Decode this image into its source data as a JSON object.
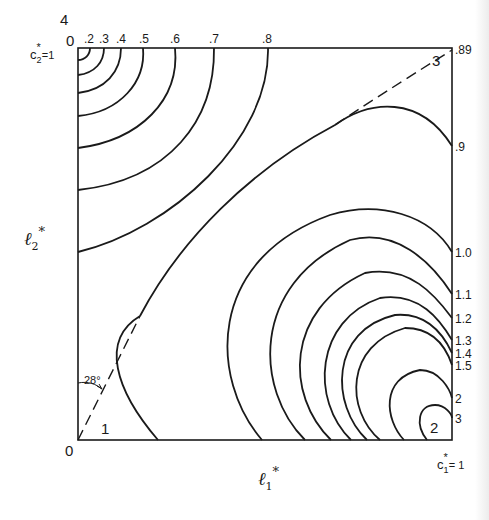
{
  "figure": {
    "axes": {
      "x_label": "ℓ",
      "x_sub": "1",
      "x_sup": "*",
      "y_label": "ℓ",
      "y_sub": "2",
      "y_sup": "*"
    },
    "corners": {
      "origin": "0",
      "top_left_value": "4",
      "top_left_zero": "0",
      "c2_label": "c",
      "c2_sub": "2",
      "c2_sup": "*",
      "c2_eq": "=1",
      "c1_label": "c",
      "c1_sub": "1",
      "c1_sup": "*",
      "c1_eq": "= 1"
    },
    "top_contour_labels": [
      ".2",
      ".3",
      ".4",
      ".5",
      ".6",
      ".7",
      ".8"
    ],
    "corner_top_right_label": ".89",
    "right_contour_labels": [
      ".9",
      "1.0",
      "1.1",
      "1.2",
      "1.3",
      "1.4",
      "1.5",
      "2",
      "3"
    ],
    "region_labels": [
      "1",
      "2",
      "3"
    ],
    "angle_annotation": "28°",
    "line_color": "#1a1a1a"
  }
}
